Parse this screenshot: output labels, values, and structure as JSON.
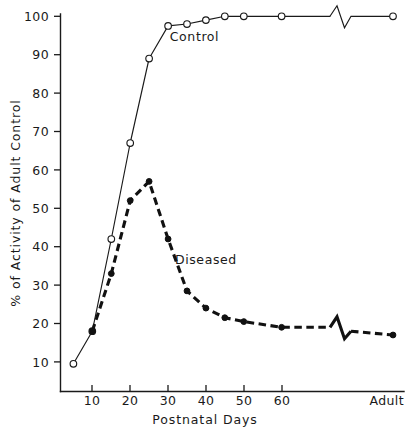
{
  "chart_data": {
    "type": "line",
    "title": "",
    "xlabel": "Postnatal Days",
    "ylabel": "% of Activity of Adult Control",
    "xlim": [
      0,
      100
    ],
    "ylim": [
      0,
      103
    ],
    "grid": false,
    "legend_position": "inline-annotations",
    "x_tick_labels": [
      "10",
      "20",
      "30",
      "40",
      "50",
      "60",
      "Adult"
    ],
    "x_tick_values": [
      10,
      20,
      30,
      40,
      50,
      60,
      100
    ],
    "y_tick_labels": [
      "10",
      "20",
      "30",
      "40",
      "50",
      "60",
      "70",
      "80",
      "90",
      "100"
    ],
    "y_tick_values": [
      10,
      20,
      30,
      40,
      50,
      60,
      70,
      80,
      90,
      100
    ],
    "axis_break": {
      "present": true,
      "style": "zigzag",
      "between_x": [
        70,
        80
      ],
      "note": "both series interrupted before the Adult point"
    },
    "series": [
      {
        "name": "Control",
        "marker": "open-circle",
        "line_style": "solid",
        "label_annotation": "Control",
        "x": [
          5,
          10,
          15,
          20,
          25,
          30,
          35,
          40,
          45,
          50,
          60,
          100
        ],
        "values": [
          9.5,
          18,
          42,
          67,
          89,
          97.5,
          98,
          99,
          100,
          100,
          100,
          100
        ]
      },
      {
        "name": "Diseased",
        "marker": "filled-circle",
        "line_style": "dashed",
        "label_annotation": "Diseased",
        "x": [
          10,
          15,
          20,
          25,
          30,
          35,
          40,
          45,
          50,
          60,
          100
        ],
        "values": [
          18,
          33,
          52,
          57,
          42,
          28.5,
          24,
          21.5,
          20.5,
          19,
          17
        ]
      }
    ],
    "annotations": [
      {
        "text": "Control",
        "x_day": 37,
        "y_value": 93.5
      },
      {
        "text": "Diseased",
        "x_day": 40,
        "y_value": 35.5
      }
    ]
  }
}
